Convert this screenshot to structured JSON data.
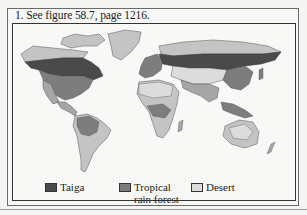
{
  "caption": "1. See figure 58.7, page 1216.",
  "map": {
    "subject": "World biome map",
    "colors": {
      "taiga": "#4a4a4a",
      "tropical_rain_forest": "#7d7d7d",
      "desert": "#dcdcdc",
      "other_biome_light": "#c4c4c4",
      "other_biome_mid": "#a6a6a6",
      "ocean": "#f8f8f6"
    }
  },
  "legend": {
    "items": [
      {
        "label": "Taiga",
        "color": "#4a4a4a"
      },
      {
        "label": "Tropical",
        "label2": "rain forest",
        "color": "#7d7d7d"
      },
      {
        "label": "Desert",
        "color": "#dcdcdc"
      }
    ]
  }
}
